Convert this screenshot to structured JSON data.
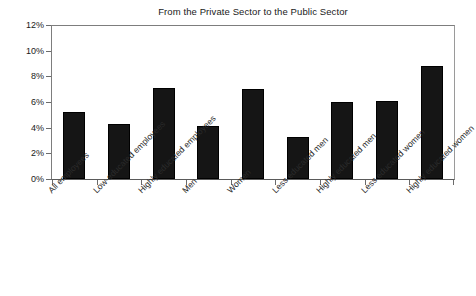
{
  "chart_data": {
    "type": "bar",
    "title": "From the Private Sector to the Public Sector",
    "xlabel": "",
    "ylabel": "",
    "categories": [
      "All employees",
      "Low-educated employees",
      "Highly educated employees",
      "Men",
      "Women",
      "Less educated men",
      "Highly educated men",
      "Less educated women",
      "Highly educated women"
    ],
    "values": [
      5.2,
      4.3,
      7.1,
      4.15,
      7.0,
      3.25,
      6.0,
      6.1,
      8.8
    ],
    "value_unit": "%",
    "ylim": [
      0,
      12
    ],
    "yticks": [
      0,
      2,
      4,
      6,
      8,
      10,
      12
    ],
    "ytick_labels": [
      "0%",
      "2%",
      "4%",
      "6%",
      "8%",
      "10%",
      "12%"
    ],
    "grid": false,
    "legend": null,
    "bar_color": "#151515",
    "axis_color": "#6b6b6b",
    "background_color": "#ffffff"
  }
}
